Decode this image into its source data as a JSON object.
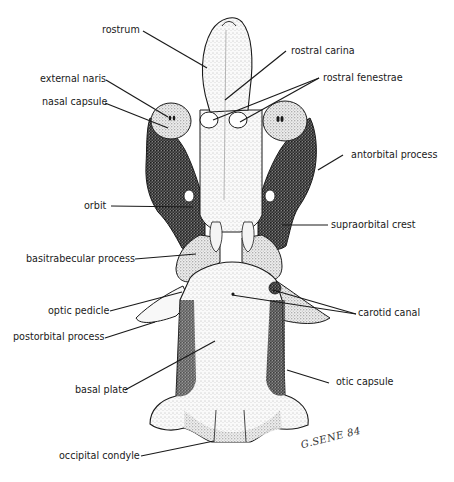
{
  "figure": {
    "signature": "G.SENE 84"
  },
  "labels": {
    "left": [
      {
        "id": "rostrum",
        "text": "rostrum"
      },
      {
        "id": "external-naris",
        "text": "external naris"
      },
      {
        "id": "nasal-capsule",
        "text": "nasal capsule"
      },
      {
        "id": "orbit",
        "text": "orbit"
      },
      {
        "id": "basitrabecular-process",
        "text": "basitrabecular process"
      },
      {
        "id": "optic-pedicle",
        "text": "optic pedicle"
      },
      {
        "id": "postorbital-process",
        "text": "postorbital process"
      },
      {
        "id": "basal-plate",
        "text": "basal plate"
      },
      {
        "id": "occipital-condyle",
        "text": "occipital condyle"
      }
    ],
    "right": [
      {
        "id": "rostral-carina",
        "text": "rostral carina"
      },
      {
        "id": "rostral-fenestrae",
        "text": "rostral fenestrae"
      },
      {
        "id": "antorbital-process",
        "text": "antorbital process"
      },
      {
        "id": "supraorbital-crest",
        "text": "supraorbital crest"
      },
      {
        "id": "carotid-canal",
        "text": "carotid canal"
      },
      {
        "id": "otic-capsule",
        "text": "otic capsule"
      }
    ]
  },
  "colors": {
    "ink": "#1a1a1a",
    "paper": "#ffffff",
    "stipple_dark": "#2a2a2a",
    "stipple_light": "#bdbdbd"
  }
}
